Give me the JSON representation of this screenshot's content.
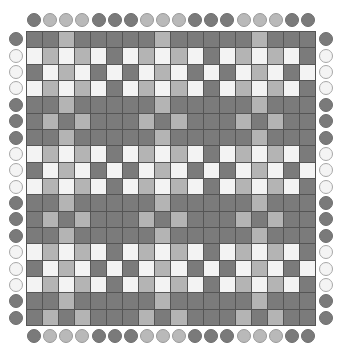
{
  "colors": {
    "D": "#7b7b7b",
    "L": "#b4b4b4",
    "W": "#f3f3f3",
    "peg_D": "#7a7a7a",
    "peg_L": "#b9b9b9",
    "peg_W": "#f4f4f4"
  },
  "grid": {
    "cols": 18,
    "rows": 18,
    "cells": [
      "DDLDDDDDLDDDDDLDDD",
      "WLWLWDWLWLWDWLWLWD",
      "DWLWDWDWLWDWDWLWDW",
      "WLWLWDWLWLWDWLWLWD",
      "DDLDDDDDLDDDDDLDDD",
      "DLDLDDDLDLDDDLDLDD",
      "DDLDDDDDLDDDDDLDDD",
      "WLWLWDWLWLWDWLWLWD",
      "DWLWDWDWLWDWDWLWDW",
      "WLWLWDWLWLWDWLWLWD",
      "DDLDDDDDLDDDDDLDDD",
      "DLDLDDDLDLDDDLDLDD",
      "DDLDDDDDLDDDDDLDDD",
      "WLWLWDWLWLWDWLWLWD",
      "DWLWDWDWLWDWDWLWDW",
      "WLWLWDWLWLWDWLWLWD",
      "DDLDDDDDLDDDDDLDDD",
      "DLDLDDDLDLDDDLDLDD"
    ]
  },
  "pegs": {
    "top": "DLLLDDDLLLDDDLLLDD",
    "bottom": "DLLLDDDLLLDDDLLLDD",
    "left": "DWWWDDDWWWDDDWWWDD",
    "right": "DWWWDDDWWWDDDWWWDD"
  }
}
